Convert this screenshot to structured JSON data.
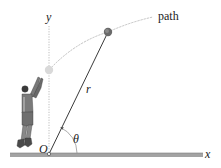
{
  "figure": {
    "labels": {
      "y_axis": "y",
      "x_axis": "x",
      "origin": "O",
      "radius": "r",
      "angle": "θ",
      "path": "path"
    },
    "colors": {
      "ground": "#a3a3a3",
      "ground_edge": "#7d7d7d",
      "axis_dotted": "#b5b5b5",
      "path_curve": "#b8b8b8",
      "r_line": "#3a3a3a",
      "ball_initial": "#d9d9d9",
      "ball_current": "#6a6a6a",
      "player": "#5a5a5a"
    }
  }
}
